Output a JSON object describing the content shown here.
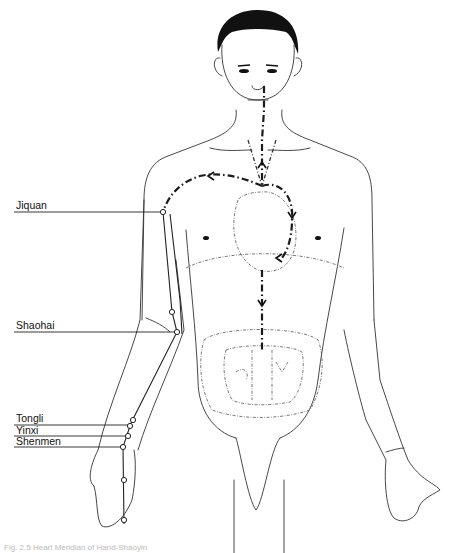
{
  "figure": {
    "caption": "Fig. 2.5 Heart Meridian of Hand-Shaoyin",
    "colors": {
      "line": "#222222",
      "background": "#ffffff"
    }
  },
  "acupoints": [
    {
      "name": "Jiquan",
      "label_x": 16,
      "label_y": 201,
      "point_x": 163,
      "point_y": 212
    },
    {
      "name": "Shaohai",
      "label_x": 16,
      "label_y": 321,
      "point_x": 177,
      "point_y": 332
    },
    {
      "name": "Tongli",
      "label_x": 16,
      "label_y": 414,
      "point_x": 131,
      "point_y": 423
    },
    {
      "name": "Yinxi",
      "label_x": 16,
      "label_y": 426,
      "point_x": 128,
      "point_y": 436
    },
    {
      "name": "Shenmen",
      "label_x": 16,
      "label_y": 437,
      "point_x": 123,
      "point_y": 447
    }
  ]
}
